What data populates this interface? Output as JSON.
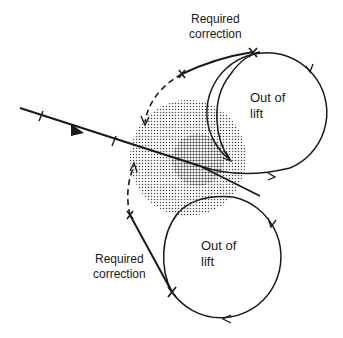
{
  "labels": {
    "upper_correction": "Required\ncorrection",
    "upper_circle": "Out of\nlift",
    "lower_circle": "Out of\nlift",
    "lower_correction": "Required\ncorrection"
  },
  "colors": {
    "ink": "#1a1a1a",
    "stipple": "#555555",
    "background": "#ffffff"
  }
}
